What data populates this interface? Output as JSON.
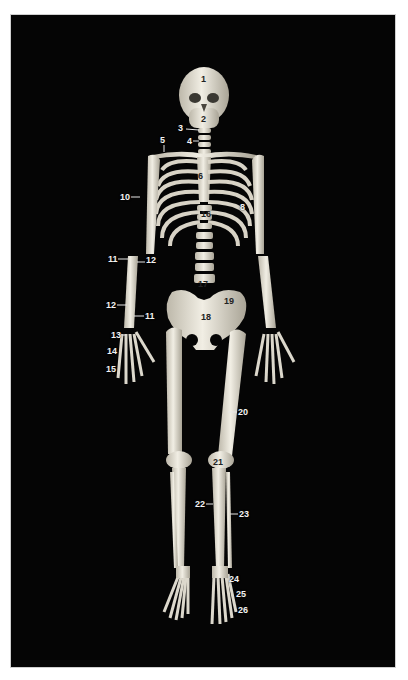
{
  "figure": {
    "background": "#050505",
    "bone_color": "#e8e4d8",
    "label_color": "#f2f2f2",
    "labels": [
      {
        "n": "1",
        "x": 201,
        "y": 75,
        "on_bone": true,
        "line": null
      },
      {
        "n": "2",
        "x": 201,
        "y": 115,
        "on_bone": true,
        "line": null
      },
      {
        "n": "3",
        "x": 178,
        "y": 124,
        "on_bone": false,
        "line": [
          186,
          129,
          199,
          130
        ]
      },
      {
        "n": "4",
        "x": 187,
        "y": 137,
        "on_bone": false,
        "line": [
          193,
          141,
          199,
          141
        ]
      },
      {
        "n": "5",
        "x": 160,
        "y": 136,
        "on_bone": false,
        "line": [
          164,
          145,
          164,
          152
        ]
      },
      {
        "n": "6",
        "x": 198,
        "y": 172,
        "on_bone": true,
        "line": null
      },
      {
        "n": "8",
        "x": 240,
        "y": 203,
        "on_bone": false,
        "line": null
      },
      {
        "n": "10",
        "x": 120,
        "y": 193,
        "on_bone": false,
        "line": [
          131,
          197,
          140,
          197
        ]
      },
      {
        "n": "16",
        "x": 201,
        "y": 210,
        "on_bone": true,
        "line": null
      },
      {
        "n": "11",
        "x": 108,
        "y": 255,
        "on_bone": false,
        "line": [
          118,
          259,
          128,
          259
        ]
      },
      {
        "n": "12",
        "x": 146,
        "y": 256,
        "on_bone": false,
        "line": [
          137,
          262,
          145,
          262
        ]
      },
      {
        "n": "17",
        "x": 198,
        "y": 280,
        "on_bone": true,
        "line": null
      },
      {
        "n": "19",
        "x": 224,
        "y": 297,
        "on_bone": true,
        "line": null
      },
      {
        "n": "12",
        "x": 106,
        "y": 301,
        "on_bone": false,
        "line": [
          117,
          305,
          127,
          305
        ]
      },
      {
        "n": "11",
        "x": 145,
        "y": 312,
        "on_bone": false,
        "line": [
          134,
          316,
          144,
          316
        ]
      },
      {
        "n": "18",
        "x": 201,
        "y": 313,
        "on_bone": true,
        "line": null
      },
      {
        "n": "13",
        "x": 111,
        "y": 331,
        "on_bone": false,
        "line": [
          120,
          335,
          126,
          335
        ]
      },
      {
        "n": "14",
        "x": 107,
        "y": 347,
        "on_bone": false,
        "line": null
      },
      {
        "n": "15",
        "x": 106,
        "y": 365,
        "on_bone": false,
        "line": null
      },
      {
        "n": "20",
        "x": 238,
        "y": 408,
        "on_bone": false,
        "line": [
          228,
          412,
          237,
          412
        ]
      },
      {
        "n": "21",
        "x": 213,
        "y": 458,
        "on_bone": true,
        "line": null
      },
      {
        "n": "22",
        "x": 195,
        "y": 500,
        "on_bone": false,
        "line": [
          206,
          504,
          213,
          504
        ]
      },
      {
        "n": "23",
        "x": 239,
        "y": 510,
        "on_bone": false,
        "line": [
          230,
          514,
          238,
          514
        ]
      },
      {
        "n": "24",
        "x": 229,
        "y": 575,
        "on_bone": false,
        "line": null
      },
      {
        "n": "25",
        "x": 236,
        "y": 590,
        "on_bone": false,
        "line": null
      },
      {
        "n": "26",
        "x": 238,
        "y": 606,
        "on_bone": false,
        "line": null
      }
    ]
  }
}
